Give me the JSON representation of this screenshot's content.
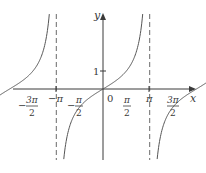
{
  "chart_data": {
    "type": "line",
    "title": "",
    "function": "y = tan x",
    "xlabel": "x",
    "ylabel": "y",
    "x_ticks": [
      {
        "value": -4.712,
        "label": "−3π/2",
        "num": "3π",
        "den": "2",
        "sign": "−"
      },
      {
        "value": -3.1416,
        "label": "−π",
        "num": "π",
        "den": "",
        "sign": "−"
      },
      {
        "value": -1.5708,
        "label": "−π/2",
        "num": "π",
        "den": "2",
        "sign": "−"
      },
      {
        "value": 0,
        "label": "0"
      },
      {
        "value": 1.5708,
        "label": "π/2",
        "num": "π",
        "den": "2",
        "sign": ""
      },
      {
        "value": 3.1416,
        "label": "π",
        "num": "π",
        "den": "",
        "sign": ""
      },
      {
        "value": 4.712,
        "label": "3π/2",
        "num": "3π",
        "den": "2",
        "sign": ""
      }
    ],
    "y_ticks": [
      {
        "value": 1,
        "label": "1"
      }
    ],
    "asymptotes_x": [
      -4.712,
      -1.5708,
      1.5708,
      4.712
    ],
    "zeros_x": [
      -3.1416,
      0,
      3.1416
    ],
    "series": [
      {
        "name": "tan x branch 1",
        "domain": [
          -4.712,
          -1.5708
        ]
      },
      {
        "name": "tan x branch 2",
        "domain": [
          -1.5708,
          1.5708
        ]
      },
      {
        "name": "tan x branch 3",
        "domain": [
          1.5708,
          4.712
        ]
      }
    ],
    "xlim": [
      -5.4,
      5.9
    ],
    "ylim": [
      -3.8,
      4.2
    ],
    "grid": false,
    "legend": "none"
  },
  "labels": {
    "x_axis": "x",
    "y_axis": "y",
    "origin": "0",
    "y_one": "1",
    "neg_three_pi_over_2_num": "3π",
    "neg_three_pi_over_2_den": "2",
    "neg_pi": "−π",
    "neg_pi_over_2_num": "π",
    "neg_pi_over_2_den": "2",
    "pi_over_2_num": "π",
    "pi_over_2_den": "2",
    "pi": "π",
    "three_pi_over_2_num": "3π",
    "three_pi_over_2_den": "2",
    "minus": "−"
  },
  "colors": {
    "axis": "#3a3a3a",
    "curve": "#555555",
    "asymptote": "#6a6a6a"
  }
}
